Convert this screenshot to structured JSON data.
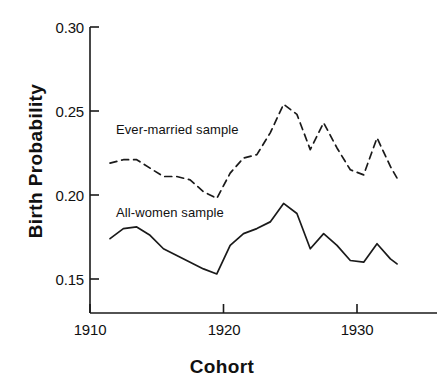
{
  "chart_data": {
    "type": "line",
    "title": "",
    "xlabel": "Cohort",
    "ylabel": "Birth Probability",
    "xlim": [
      1910,
      1933.5
    ],
    "ylim": [
      0.135,
      0.3
    ],
    "grid": false,
    "legend_position": "inline-annotations",
    "xticks": [
      1910,
      1920,
      1930
    ],
    "xtick_labels": [
      "1910",
      "1920",
      "1930"
    ],
    "yticks": [
      0.15,
      0.2,
      0.25,
      0.3
    ],
    "ytick_labels": [
      "0.15",
      "0.20",
      "0.25",
      "0.30"
    ],
    "x": [
      1911.5,
      1912.5,
      1913.5,
      1914.5,
      1915.5,
      1916.5,
      1917.5,
      1918.5,
      1919.5,
      1920.5,
      1921.5,
      1922.5,
      1923.5,
      1924.5,
      1925.5,
      1926.5,
      1927.5,
      1928.5,
      1929.5,
      1930.5,
      1931.5,
      1932.5,
      1933.0
    ],
    "series": [
      {
        "name": "Ever-married sample",
        "style": "dashed",
        "color": "#1a1a1a",
        "values": [
          0.219,
          0.221,
          0.221,
          0.216,
          0.211,
          0.211,
          0.209,
          0.202,
          0.198,
          0.213,
          0.222,
          0.224,
          0.237,
          0.254,
          0.248,
          0.227,
          0.243,
          0.228,
          0.215,
          0.212,
          0.234,
          0.217,
          0.21
        ]
      },
      {
        "name": "All-women sample",
        "style": "solid",
        "color": "#1a1a1a",
        "values": [
          0.174,
          0.18,
          0.181,
          0.176,
          0.168,
          0.164,
          0.16,
          0.156,
          0.153,
          0.17,
          0.177,
          0.18,
          0.184,
          0.195,
          0.189,
          0.168,
          0.177,
          0.17,
          0.161,
          0.16,
          0.171,
          0.162,
          0.159
        ]
      }
    ],
    "annotations": [
      {
        "text": "Ever-married sample",
        "x": 1911.6,
        "y": 0.2355
      },
      {
        "text": "All-women sample",
        "x": 1911.6,
        "y": 0.1885
      }
    ]
  },
  "axis": {
    "ylabel_text": "Birth Probability",
    "xlabel_text": "Cohort"
  }
}
